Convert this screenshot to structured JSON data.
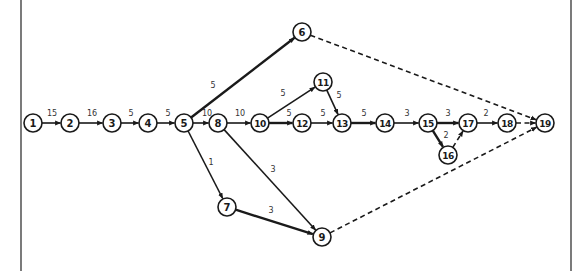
{
  "diagram": {
    "type": "activity-on-arrow network",
    "frame": {
      "left_x": 21,
      "right_x": 571
    },
    "colors": {
      "line": "#1a1a1a",
      "label": "#333333",
      "background": "#ffffff"
    },
    "nodes": [
      {
        "id": "1",
        "x": 33,
        "y": 123
      },
      {
        "id": "2",
        "x": 70,
        "y": 123
      },
      {
        "id": "3",
        "x": 112,
        "y": 123
      },
      {
        "id": "4",
        "x": 148,
        "y": 123
      },
      {
        "id": "5",
        "x": 184,
        "y": 123
      },
      {
        "id": "6",
        "x": 302,
        "y": 32
      },
      {
        "id": "7",
        "x": 227,
        "y": 207
      },
      {
        "id": "8",
        "x": 218,
        "y": 123
      },
      {
        "id": "9",
        "x": 322,
        "y": 237
      },
      {
        "id": "10",
        "x": 260,
        "y": 123
      },
      {
        "id": "11",
        "x": 323,
        "y": 82
      },
      {
        "id": "12",
        "x": 302,
        "y": 123
      },
      {
        "id": "13",
        "x": 342,
        "y": 123
      },
      {
        "id": "14",
        "x": 385,
        "y": 123
      },
      {
        "id": "15",
        "x": 428,
        "y": 123
      },
      {
        "id": "16",
        "x": 448,
        "y": 155
      },
      {
        "id": "17",
        "x": 468,
        "y": 123
      },
      {
        "id": "18",
        "x": 507,
        "y": 123
      },
      {
        "id": "19",
        "x": 545,
        "y": 123
      }
    ],
    "edges": [
      {
        "from": "1",
        "to": "2",
        "label": "15",
        "style": "solid",
        "lx": 52,
        "ly": 116
      },
      {
        "from": "2",
        "to": "3",
        "label": "16",
        "style": "solid",
        "lx": 92,
        "ly": 116
      },
      {
        "from": "3",
        "to": "4",
        "label": "5",
        "style": "solid",
        "lx": 131,
        "ly": 116
      },
      {
        "from": "4",
        "to": "5",
        "label": "5",
        "style": "solid",
        "lx": 168,
        "ly": 116
      },
      {
        "from": "5",
        "to": "6",
        "label": "5",
        "style": "heavy",
        "lx": 213,
        "ly": 88
      },
      {
        "from": "5",
        "to": "8",
        "label": "10",
        "style": "solid",
        "lx": 207,
        "ly": 116
      },
      {
        "from": "5",
        "to": "7",
        "label": "1",
        "style": "solid",
        "lx": 211,
        "ly": 165
      },
      {
        "from": "8",
        "to": "10",
        "label": "10",
        "style": "solid",
        "lx": 240,
        "ly": 116
      },
      {
        "from": "8",
        "to": "9",
        "label": "3",
        "style": "solid",
        "lx": 273,
        "ly": 172
      },
      {
        "from": "7",
        "to": "9",
        "label": "3",
        "style": "heavy",
        "lx": 271,
        "ly": 213
      },
      {
        "from": "10",
        "to": "11",
        "label": "5",
        "style": "solid",
        "lx": 283,
        "ly": 96
      },
      {
        "from": "10",
        "to": "12",
        "label": "5",
        "style": "heavy",
        "lx": 289,
        "ly": 116
      },
      {
        "from": "11",
        "to": "13",
        "label": "5",
        "style": "solid",
        "lx": 339,
        "ly": 98
      },
      {
        "from": "12",
        "to": "13",
        "label": "5",
        "style": "solid",
        "lx": 323,
        "ly": 116
      },
      {
        "from": "13",
        "to": "14",
        "label": "5",
        "style": "heavy",
        "lx": 364,
        "ly": 116
      },
      {
        "from": "14",
        "to": "15",
        "label": "3",
        "style": "solid",
        "lx": 407,
        "ly": 116
      },
      {
        "from": "15",
        "to": "17",
        "label": "3",
        "style": "heavy",
        "lx": 448,
        "ly": 116
      },
      {
        "from": "15",
        "to": "16",
        "label": "2",
        "style": "heavy",
        "lx": 446,
        "ly": 138
      },
      {
        "from": "16",
        "to": "17",
        "label": "",
        "style": "dummy",
        "lx": 0,
        "ly": 0
      },
      {
        "from": "17",
        "to": "18",
        "label": "2",
        "style": "solid",
        "lx": 486,
        "ly": 116
      },
      {
        "from": "18",
        "to": "19",
        "label": "",
        "style": "dummy",
        "lx": 0,
        "ly": 0
      },
      {
        "from": "6",
        "to": "19",
        "label": "",
        "style": "dummy",
        "lx": 0,
        "ly": 0
      },
      {
        "from": "9",
        "to": "19",
        "label": "",
        "style": "dummy",
        "lx": 0,
        "ly": 0
      }
    ]
  }
}
